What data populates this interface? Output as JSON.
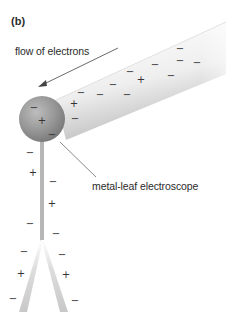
{
  "figure": {
    "panel_label": "(b)",
    "flow_label": "flow of electrons",
    "device_label": "metal-leaf electroscope"
  },
  "colors": {
    "rod_light": "#f4f4f4",
    "rod_shade": "#c9c9c9",
    "sphere": "#8f8f8f",
    "sphere_highlight": "#c4c4c4",
    "stem": "#8a8a8a",
    "leaf": "#d6d6d6",
    "text": "#2b2b2b"
  },
  "charges": {
    "rod": [
      {
        "sign": "−",
        "x": 180,
        "y": 49
      },
      {
        "sign": "−",
        "x": 180,
        "y": 61
      },
      {
        "sign": "−",
        "x": 197,
        "y": 63
      },
      {
        "sign": "−",
        "x": 155,
        "y": 65
      },
      {
        "sign": "−",
        "x": 130,
        "y": 72
      },
      {
        "sign": "+",
        "x": 141,
        "y": 80
      },
      {
        "sign": "−",
        "x": 171,
        "y": 76
      },
      {
        "sign": "−",
        "x": 113,
        "y": 85
      },
      {
        "sign": "−",
        "x": 81,
        "y": 93
      },
      {
        "sign": "−",
        "x": 100,
        "y": 95
      },
      {
        "sign": "−",
        "x": 127,
        "y": 95
      },
      {
        "sign": "+",
        "x": 74,
        "y": 104
      },
      {
        "sign": "−",
        "x": 75,
        "y": 119
      }
    ],
    "sphere": [
      {
        "sign": "−",
        "x": 34,
        "y": 108
      },
      {
        "sign": "+",
        "x": 42,
        "y": 121
      },
      {
        "sign": "−",
        "x": 52,
        "y": 135
      }
    ],
    "stem": [
      {
        "sign": "−",
        "x": 30,
        "y": 153
      },
      {
        "sign": "+",
        "x": 33,
        "y": 173
      },
      {
        "sign": "−",
        "x": 53,
        "y": 182
      },
      {
        "sign": "+",
        "x": 52,
        "y": 204
      },
      {
        "sign": "−",
        "x": 30,
        "y": 224
      },
      {
        "sign": "−",
        "x": 56,
        "y": 234
      }
    ],
    "leaves": [
      {
        "sign": "−",
        "x": 24,
        "y": 252
      },
      {
        "sign": "−",
        "x": 62,
        "y": 255
      },
      {
        "sign": "+",
        "x": 21,
        "y": 274
      },
      {
        "sign": "+",
        "x": 66,
        "y": 275
      },
      {
        "sign": "−",
        "x": 13,
        "y": 299
      },
      {
        "sign": "−",
        "x": 75,
        "y": 301
      }
    ]
  }
}
